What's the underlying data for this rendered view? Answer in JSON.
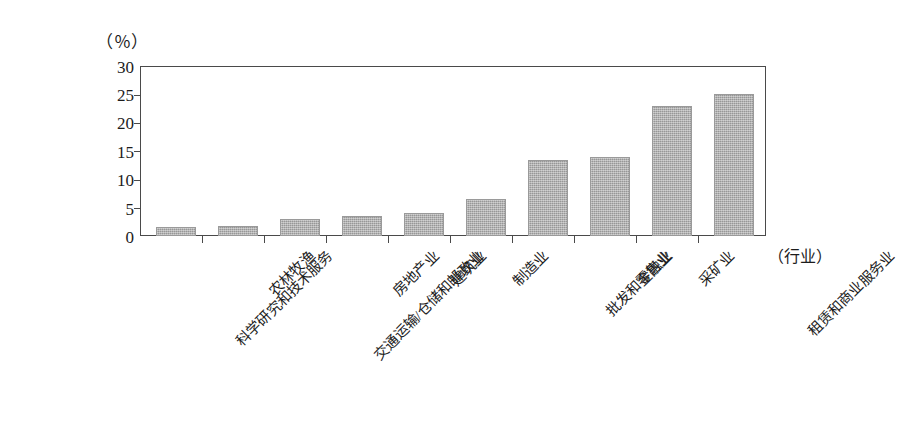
{
  "chart_data": {
    "type": "bar",
    "title": "",
    "subtitle": "",
    "xlabel": "（行业）",
    "ylabel": "（％）",
    "ylim": [
      0,
      30
    ],
    "ytick_labels": [
      "30",
      "25",
      "20",
      "15",
      "10",
      "5",
      "0"
    ],
    "ytick_values": [
      30,
      25,
      20,
      15,
      10,
      5,
      0
    ],
    "grid": false,
    "legend": null,
    "categories": [
      "科学研究和技术服务",
      "农林牧渔",
      "交通运输/仓储和邮政业",
      "房地产业",
      "建筑业",
      "制造业",
      "批发和零售业",
      "金融业",
      "采矿业",
      "租赁和商业服务业"
    ],
    "values": [
      1.6,
      1.8,
      3.0,
      3.6,
      4.0,
      6.5,
      13.5,
      14.0,
      23.0,
      25.0
    ],
    "bar_color": "#a9a9a9",
    "bar_edge_color": "#9a9a9a",
    "axis_color": "#4a4a4a",
    "background_color": "#ffffff"
  }
}
